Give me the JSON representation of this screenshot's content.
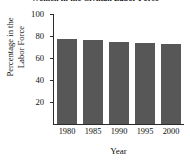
{
  "chart_data": {
    "type": "bar",
    "title": "Women in the Civilian Labor Force",
    "xlabel": "Year",
    "ylabel_lines": [
      "Percentage in the",
      "Labor Force"
    ],
    "categories": [
      "1980",
      "1985",
      "1990",
      "1995",
      "2000"
    ],
    "values": [
      77,
      76,
      75,
      74,
      73
    ],
    "ylim": [
      0,
      100
    ],
    "yticks": [
      20,
      40,
      60,
      80,
      100
    ],
    "ytick_labels": [
      "20",
      "40",
      "60",
      "80",
      "100"
    ],
    "grid": false,
    "legend": false,
    "bar_color": "#575757",
    "axis_color": "#2b2b2b"
  }
}
